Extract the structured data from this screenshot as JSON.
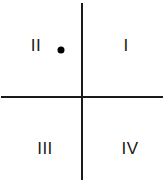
{
  "diagram": {
    "title": "",
    "type": "coordinate-plane-quadrants",
    "colors": {
      "line": "#1a1a1a",
      "text": "#1a1a1a",
      "point": "#000000",
      "background": "#ffffff"
    },
    "axes": {
      "vertical": {
        "x": 82,
        "y_start": 3,
        "y_end": 180
      },
      "horizontal": {
        "y": 97,
        "x_start": 1,
        "x_end": 163
      }
    },
    "quadrants": [
      {
        "id": "q1",
        "label": "I",
        "x": 126,
        "y": 45
      },
      {
        "id": "q2",
        "label": "II",
        "x": 36,
        "y": 45
      },
      {
        "id": "q3",
        "label": "III",
        "x": 45,
        "y": 148
      },
      {
        "id": "q4",
        "label": "IV",
        "x": 130,
        "y": 148
      }
    ],
    "points": [
      {
        "quadrant": "II",
        "x": 61,
        "y": 50
      }
    ]
  }
}
